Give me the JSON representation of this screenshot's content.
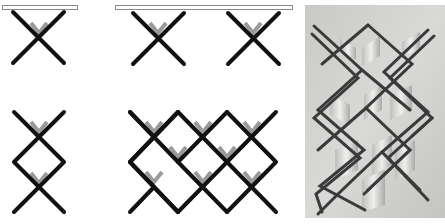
{
  "figure": {
    "title": "Lattice shelving modules",
    "panels": [
      {
        "id": "single-x-with-shelf",
        "description": "Single X module under a shelf board"
      },
      {
        "id": "double-x-with-shelf",
        "description": "Two X modules supporting a long shelf board"
      },
      {
        "id": "vertical-stack",
        "description": "Two X modules stacked vertically forming a diamond"
      },
      {
        "id": "lattice-grid",
        "description": "2x3 lattice grid of X modules"
      },
      {
        "id": "photo",
        "description": "Photograph of the assembled lattice bookshelf"
      }
    ]
  },
  "colors": {
    "rod": "#111111",
    "bracket": "#9a9a9a",
    "shelf_outline": "#8a8a8a",
    "photo_bg": "#d4d4d2",
    "photo_rod": "#3a3a3a",
    "photo_panel": "#efefed"
  }
}
